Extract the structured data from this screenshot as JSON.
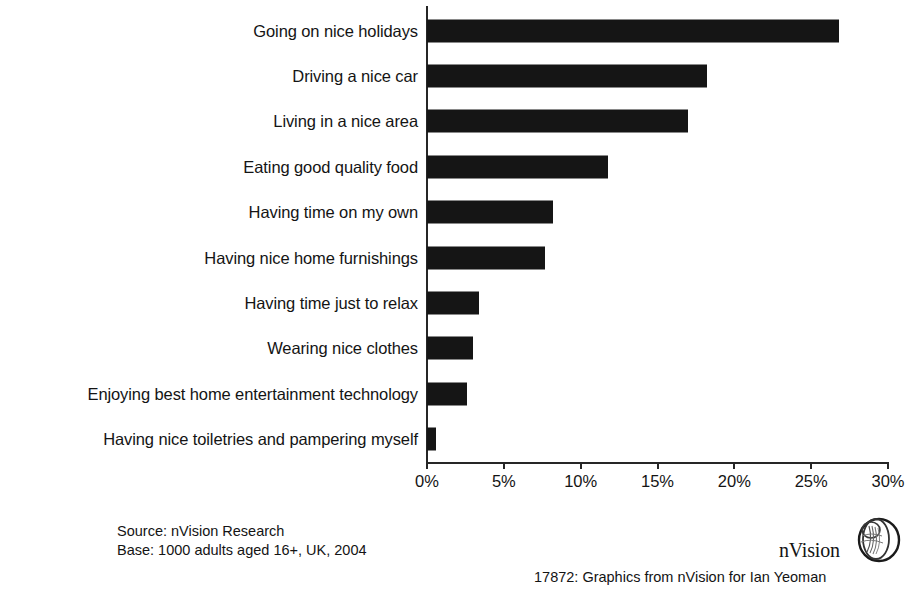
{
  "chart_data": {
    "type": "bar",
    "orientation": "horizontal",
    "title": "",
    "subtitle": "",
    "xlabel": "",
    "ylabel": "",
    "xlim": [
      0,
      30
    ],
    "grid": false,
    "legend": null,
    "tick_suffix": "%",
    "tick_labels": [
      "0%",
      "5%",
      "10%",
      "15%",
      "20%",
      "25%",
      "30%"
    ],
    "ticks": [
      0,
      5,
      10,
      15,
      20,
      25,
      30
    ],
    "bar_color": "#151515",
    "axis_color": "#262626",
    "categories": [
      "Going on nice holidays",
      "Driving a nice car",
      "Living in a nice area",
      "Eating good quality food",
      "Having time on my own",
      "Having nice home furnishings",
      "Having time just to relax",
      "Wearing nice clothes",
      "Enjoying best home entertainment technology",
      "Having nice toiletries and pampering myself"
    ],
    "values": [
      26.8,
      18.2,
      17.0,
      11.8,
      8.2,
      7.7,
      3.4,
      3.0,
      2.6,
      0.6
    ]
  },
  "footer": {
    "source_line": "Source: nVision Research",
    "base_line": "Base: 1000 adults aged 16+, UK, 2004",
    "credit": "17872: Graphics from  nVision  for Ian Yeoman",
    "logo_text": "nVision"
  }
}
